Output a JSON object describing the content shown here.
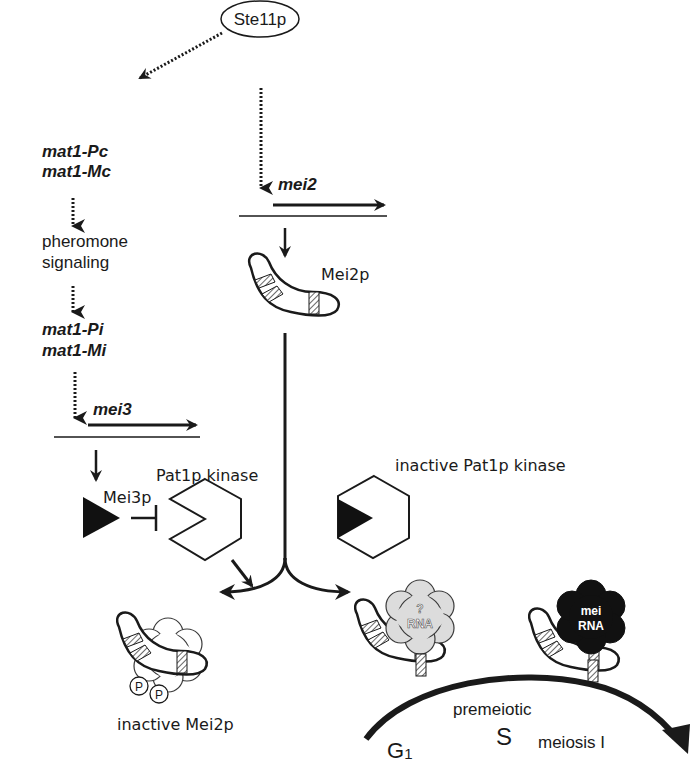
{
  "diagram": {
    "nodes": {
      "ste11": {
        "label": "Ste11p"
      },
      "mat1_pc": {
        "label": "mat1-Pc"
      },
      "mat1_mc": {
        "label": "mat1-Mc"
      },
      "pheromone_1": {
        "label": "pheromone"
      },
      "pheromone_2": {
        "label": "signaling"
      },
      "mat1_pi": {
        "label": "mat1-Pi"
      },
      "mat1_mi": {
        "label": "mat1-Mi"
      },
      "mei3_gene": {
        "label": "mei3"
      },
      "mei2_gene": {
        "label": "mei2"
      },
      "mei2p": {
        "label": "Mei2p"
      },
      "mei3p": {
        "label": "Mei3p"
      },
      "pat1_kinase": {
        "label": "Pat1p kinase"
      },
      "inactive_pat1": {
        "label": "inactive Pat1p kinase"
      },
      "inactive_mei2p": {
        "label": "inactive Mei2p"
      },
      "phospho_1": {
        "label": "P"
      },
      "phospho_2": {
        "label": "P"
      },
      "unknown_rna_q": {
        "label": "?"
      },
      "unknown_rna": {
        "label": "RNA"
      },
      "mei_rna_1": {
        "label": "mei"
      },
      "mei_rna_2": {
        "label": "RNA"
      }
    },
    "cell_cycle": {
      "g1": "G",
      "g1_sub": "1",
      "premeiotic": "premeiotic",
      "s": "S",
      "meiosis": "meiosis I"
    },
    "edges": [
      {
        "from": "Ste11p",
        "to": "mat1-Pc/mat1-Mc",
        "style": "dotted"
      },
      {
        "from": "Ste11p",
        "to": "mei2",
        "style": "dotted"
      },
      {
        "from": "mat1-Pc/mat1-Mc",
        "to": "pheromone signaling",
        "style": "dotted"
      },
      {
        "from": "pheromone signaling",
        "to": "mat1-Pi/mat1-Mi",
        "style": "dotted"
      },
      {
        "from": "mat1-Pi/mat1-Mi",
        "to": "mei3",
        "style": "dotted"
      },
      {
        "from": "mei3",
        "to": "Mei3p",
        "style": "solid"
      },
      {
        "from": "mei2",
        "to": "Mei2p",
        "style": "solid"
      },
      {
        "from": "Mei3p",
        "to": "Pat1p kinase",
        "style": "inhibition"
      },
      {
        "from": "Pat1p kinase",
        "to": "inactive Mei2p",
        "style": "solid"
      },
      {
        "from": "Mei2p",
        "to": "inactive Mei2p",
        "style": "branch"
      },
      {
        "from": "Mei2p",
        "to": "Mei2p-RNA complex",
        "style": "branch"
      }
    ],
    "colors": {
      "ink": "#1a1a1a",
      "hatch": "#8a8a8a",
      "unknown_rna_fill": "#dcdcdc",
      "mei_rna_fill": "#111111",
      "background": "#ffffff"
    }
  }
}
